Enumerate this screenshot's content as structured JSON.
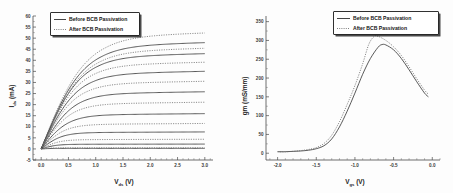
{
  "figure": {
    "background_color": "#fdfdfd",
    "axis_color": "#4a4a4a",
    "solid_color": "#3c3c3c",
    "dotted_color": "#6d6d6d"
  },
  "legend": {
    "before_label": "Before BCB Passivation",
    "after_label": "After BCB Passivation",
    "before_style": "solid",
    "after_style": "dotted"
  },
  "chart_data": [
    {
      "type": "line",
      "panel": "left",
      "title": "",
      "xlabel": "V",
      "xlabel_sub": "ds",
      "xlabel_unit": " (V)",
      "ylabel": "I",
      "ylabel_sub": "ds",
      "ylabel_unit": " (mA)",
      "xlim": [
        -0.15,
        3.15
      ],
      "ylim": [
        -5,
        60
      ],
      "xticks": [
        0.0,
        0.5,
        1.0,
        1.5,
        2.0,
        2.5,
        3.0
      ],
      "xticklabels": [
        "0.0",
        "0.5",
        "1.0",
        "1.5",
        "2.0",
        "2.5",
        "3.0"
      ],
      "yticks": [
        -5,
        0,
        5,
        10,
        15,
        20,
        25,
        30,
        35,
        40,
        45,
        50,
        55,
        60
      ],
      "yticklabels": [
        "-5",
        "0",
        "5",
        "10",
        "15",
        "20",
        "25",
        "30",
        "35",
        "40",
        "45",
        "50",
        "55",
        "60"
      ],
      "grid": false,
      "legend_position": "upper-left",
      "series": [
        {
          "name": "Before BCB Passivation",
          "style": "solid",
          "sat": 46.7,
          "knee": 1.12
        },
        {
          "name": "Before BCB Passivation",
          "style": "solid",
          "sat": 41.8,
          "knee": 1.05
        },
        {
          "name": "Before BCB Passivation",
          "style": "solid",
          "sat": 34.0,
          "knee": 0.96
        },
        {
          "name": "Before BCB Passivation",
          "style": "solid",
          "sat": 25.0,
          "knee": 0.86
        },
        {
          "name": "Before BCB Passivation",
          "style": "solid",
          "sat": 15.4,
          "knee": 0.72
        },
        {
          "name": "Before BCB Passivation",
          "style": "solid",
          "sat": 7.4,
          "knee": 0.56
        },
        {
          "name": "Before BCB Passivation",
          "style": "solid",
          "sat": 2.1,
          "knee": 0.4
        },
        {
          "name": "Before BCB Passivation",
          "style": "solid",
          "sat": 0.25,
          "knee": 0.25
        },
        {
          "name": "After BCB Passivation",
          "style": "dotted",
          "sat": 51.0,
          "knee": 1.18
        },
        {
          "name": "After BCB Passivation",
          "style": "dotted",
          "sat": 44.2,
          "knee": 1.1
        },
        {
          "name": "After BCB Passivation",
          "style": "dotted",
          "sat": 38.0,
          "knee": 1.0
        },
        {
          "name": "After BCB Passivation",
          "style": "dotted",
          "sat": 29.6,
          "knee": 0.9
        },
        {
          "name": "After BCB Passivation",
          "style": "dotted",
          "sat": 20.4,
          "knee": 0.78
        },
        {
          "name": "After BCB Passivation",
          "style": "dotted",
          "sat": 11.1,
          "knee": 0.64
        },
        {
          "name": "After BCB Passivation",
          "style": "dotted",
          "sat": 4.2,
          "knee": 0.48
        },
        {
          "name": "After BCB Passivation",
          "style": "dotted",
          "sat": 0.5,
          "knee": 0.3
        }
      ]
    },
    {
      "type": "line",
      "panel": "right",
      "title": "",
      "xlabel": "V",
      "xlabel_sub": "gs",
      "xlabel_unit": " (V)",
      "ylabel": "gm (mS/mm)",
      "xlim": [
        -2.15,
        0.1
      ],
      "ylim": [
        -18,
        365
      ],
      "xticks": [
        -2.0,
        -1.5,
        -1.0,
        -0.5,
        0.0
      ],
      "xticklabels": [
        "-2.0",
        "-1.5",
        "-1.0",
        "-0.5",
        "0.0"
      ],
      "yticks": [
        0,
        50,
        100,
        150,
        200,
        250,
        300,
        350
      ],
      "yticklabels": [
        "0",
        "50",
        "100",
        "150",
        "200",
        "250",
        "300",
        "350"
      ],
      "grid": false,
      "legend_position": "upper-right",
      "series": [
        {
          "name": "Before BCB Passivation",
          "style": "solid",
          "x": [
            -2.0,
            -1.9,
            -1.8,
            -1.7,
            -1.6,
            -1.5,
            -1.4,
            -1.3,
            -1.2,
            -1.1,
            -1.0,
            -0.9,
            -0.8,
            -0.7,
            -0.65,
            -0.6,
            -0.5,
            -0.4,
            -0.3,
            -0.2,
            -0.1,
            -0.05
          ],
          "y": [
            4,
            4,
            5,
            6,
            8,
            12,
            20,
            38,
            70,
            112,
            160,
            210,
            252,
            282,
            289,
            288,
            275,
            252,
            222,
            190,
            160,
            150
          ]
        },
        {
          "name": "After BCB Passivation",
          "style": "dotted",
          "x": [
            -2.0,
            -1.9,
            -1.8,
            -1.7,
            -1.6,
            -1.5,
            -1.4,
            -1.3,
            -1.2,
            -1.1,
            -1.0,
            -0.9,
            -0.82,
            -0.75,
            -0.7,
            -0.6,
            -0.5,
            -0.4,
            -0.3,
            -0.2,
            -0.1,
            -0.05
          ],
          "y": [
            4,
            4,
            5,
            7,
            10,
            15,
            26,
            48,
            84,
            130,
            180,
            238,
            290,
            311,
            311,
            300,
            283,
            260,
            230,
            198,
            168,
            157
          ]
        }
      ]
    }
  ]
}
